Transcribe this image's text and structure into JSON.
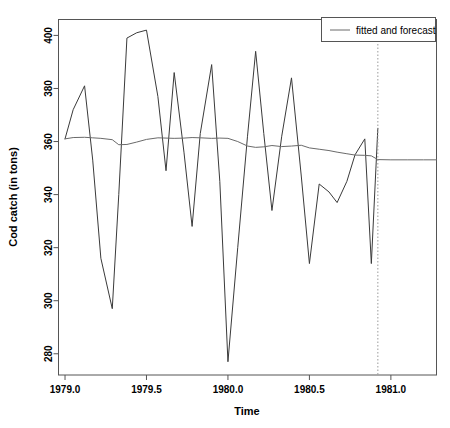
{
  "chart_data": {
    "type": "line",
    "title": "",
    "xlabel": "Time",
    "ylabel": "Cod catch (in tons)",
    "xlim": [
      1978.96,
      1981.28
    ],
    "ylim": [
      272,
      406
    ],
    "grid": false,
    "xticks": [
      1979.0,
      1979.5,
      1980.0,
      1980.5,
      1981.0
    ],
    "xtick_labels": [
      "1979.0",
      "1979.5",
      "1980.0",
      "1980.5",
      "1981.0"
    ],
    "yticks": [
      280,
      300,
      320,
      340,
      360,
      380,
      400
    ],
    "ytick_labels": [
      "280",
      "300",
      "320",
      "340",
      "360",
      "380",
      "400"
    ],
    "legend": {
      "position": "top-right",
      "entries": [
        {
          "label": "fitted and forecast",
          "marker": "line",
          "color": "#6a6a6a"
        }
      ]
    },
    "annotations": [
      {
        "name": "forecast-start-divider",
        "type": "vline",
        "x": 1980.92,
        "style": "dotted",
        "color": "#9a9a9a"
      }
    ],
    "series": [
      {
        "name": "observed",
        "style": "solid",
        "color": "#3a3a3a",
        "x": [
          1979.0,
          1979.05,
          1979.12,
          1979.17,
          1979.22,
          1979.29,
          1979.33,
          1979.38,
          1979.44,
          1979.5,
          1979.57,
          1979.62,
          1979.67,
          1979.73,
          1979.78,
          1979.83,
          1979.9,
          1979.95,
          1980.0,
          1980.06,
          1980.12,
          1980.17,
          1980.22,
          1980.27,
          1980.33,
          1980.39,
          1980.45,
          1980.5,
          1980.56,
          1980.62,
          1980.67,
          1980.73,
          1980.78,
          1980.84,
          1980.88,
          1980.92
        ],
        "y": [
          361,
          372,
          381,
          353,
          316,
          297,
          340,
          399,
          401,
          402,
          377,
          349,
          386,
          356,
          328,
          363,
          389,
          345,
          277,
          320,
          362,
          394,
          363,
          334,
          362,
          384,
          347,
          314,
          344,
          341,
          337,
          345,
          355,
          361,
          314,
          365
        ]
      },
      {
        "name": "fitted and forecast",
        "style": "solid",
        "color": "#6a6a6a",
        "x": [
          1979.0,
          1979.05,
          1979.12,
          1979.17,
          1979.22,
          1979.29,
          1979.33,
          1979.38,
          1979.44,
          1979.5,
          1979.57,
          1979.62,
          1979.67,
          1979.73,
          1979.78,
          1979.83,
          1979.9,
          1979.95,
          1980.0,
          1980.06,
          1980.12,
          1980.17,
          1980.22,
          1980.27,
          1980.33,
          1980.39,
          1980.45,
          1980.5,
          1980.56,
          1980.62,
          1980.67,
          1980.73,
          1980.78,
          1980.84,
          1980.88,
          1980.92,
          1981.0,
          1981.1,
          1981.2,
          1981.28
        ],
        "y": [
          361,
          361.5,
          361.6,
          361.4,
          361.2,
          360.7,
          358.8,
          358.9,
          359.8,
          360.8,
          361.4,
          361.3,
          361.2,
          361.3,
          361.5,
          361.4,
          361.2,
          361.3,
          361.2,
          360.0,
          358.3,
          357.8,
          358.0,
          358.5,
          358.1,
          358.3,
          358.6,
          357.6,
          357.1,
          356.6,
          356.0,
          355.4,
          354.9,
          354.8,
          354.6,
          353.2,
          353.1,
          353.1,
          353.1,
          353.1
        ]
      }
    ]
  },
  "axis_titles": {
    "x": "Time",
    "y": "Cod catch (in tons)"
  },
  "legend_entry_label": "fitted and forecast"
}
